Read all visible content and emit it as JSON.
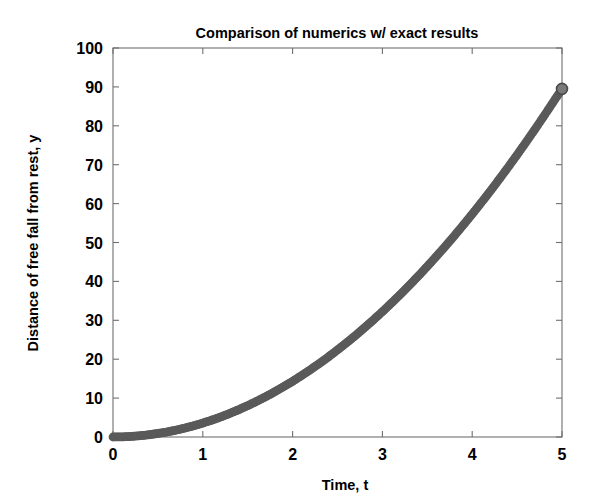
{
  "figure": {
    "background_color": "#ffffff",
    "width": 598,
    "height": 501
  },
  "chart_data": {
    "type": "line",
    "title": "Comparison of numerics w/ exact results",
    "xlabel": "Time, t",
    "ylabel": "Distance of free fall from rest, y",
    "xlim": [
      0,
      5
    ],
    "ylim": [
      0,
      100
    ],
    "xticks": [
      0,
      1,
      2,
      3,
      4,
      5
    ],
    "xticklabels": [
      "0",
      "1",
      "2",
      "3",
      "4",
      "5"
    ],
    "yticks": [
      0,
      10,
      20,
      30,
      40,
      50,
      60,
      70,
      80,
      90,
      100
    ],
    "yticklabels": [
      "0",
      "10",
      "20",
      "30",
      "40",
      "50",
      "60",
      "70",
      "80",
      "90",
      "100"
    ],
    "grid": false,
    "legend": null,
    "legend_position": "none",
    "curve_color": "#5a5a5a",
    "marker": "circle",
    "line_width": 7,
    "x": [
      0,
      0.1,
      0.2,
      0.3,
      0.4,
      0.5,
      0.6,
      0.7,
      0.8,
      0.9,
      1.0,
      1.1,
      1.2,
      1.3,
      1.4,
      1.5,
      1.6,
      1.7,
      1.8,
      1.9,
      2.0,
      2.1,
      2.2,
      2.3,
      2.4,
      2.5,
      2.6,
      2.7,
      2.8,
      2.9,
      3.0,
      3.1,
      3.2,
      3.3,
      3.4,
      3.5,
      3.6,
      3.7,
      3.8,
      3.9,
      4.0,
      4.1,
      4.2,
      4.3,
      4.4,
      4.5,
      4.6,
      4.7,
      4.8,
      4.9,
      5.0
    ],
    "series": [
      {
        "name": "numerics",
        "values": [
          0.0,
          0.04,
          0.14,
          0.32,
          0.57,
          0.9,
          1.29,
          1.75,
          2.29,
          2.9,
          3.58,
          4.33,
          5.15,
          6.05,
          7.02,
          8.06,
          9.17,
          10.35,
          11.6,
          12.93,
          14.32,
          15.79,
          17.33,
          18.94,
          20.62,
          22.38,
          24.2,
          26.1,
          28.07,
          30.11,
          32.22,
          34.41,
          36.66,
          38.99,
          41.39,
          43.86,
          46.41,
          49.02,
          51.71,
          54.47,
          57.3,
          60.21,
          63.18,
          66.23,
          69.35,
          72.54,
          75.81,
          79.14,
          82.55,
          86.03,
          89.5
        ]
      },
      {
        "name": "exact",
        "values": [
          0.0,
          0.04,
          0.14,
          0.32,
          0.57,
          0.9,
          1.29,
          1.75,
          2.29,
          2.9,
          3.58,
          4.33,
          5.15,
          6.05,
          7.02,
          8.06,
          9.17,
          10.35,
          11.6,
          12.93,
          14.32,
          15.79,
          17.33,
          18.94,
          20.62,
          22.38,
          24.2,
          26.1,
          28.07,
          30.11,
          32.22,
          34.41,
          36.66,
          38.99,
          41.39,
          43.86,
          46.41,
          49.02,
          51.71,
          54.47,
          57.3,
          60.21,
          63.18,
          66.23,
          69.35,
          72.54,
          75.81,
          79.14,
          82.55,
          86.03,
          89.5
        ]
      }
    ],
    "endpoint_marker": {
      "x": 5,
      "y": 89.5
    }
  }
}
